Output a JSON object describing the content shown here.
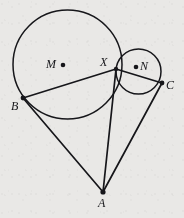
{
  "figure": {
    "type": "geometry-diagram",
    "background_color": "#e9e8e6",
    "stroke_color": "#16161a",
    "width": 184,
    "height": 218,
    "circles": [
      {
        "id": "circle-M",
        "label": "M",
        "cx": 67.5,
        "cy": 64.5,
        "r": 54.5
      },
      {
        "id": "circle-N",
        "label": "N",
        "cx": 138.5,
        "cy": 71.5,
        "r": 22.5
      }
    ],
    "points": [
      {
        "id": "M",
        "label": "M",
        "x": 63,
        "y": 65,
        "dot": true,
        "label_x": 46,
        "label_y": 58
      },
      {
        "id": "N",
        "label": "N",
        "x": 136,
        "y": 67,
        "dot": true,
        "label_x": 140,
        "label_y": 60
      },
      {
        "id": "X",
        "label": "X",
        "x": 116,
        "y": 69,
        "dot": false,
        "label_x": 100,
        "label_y": 56
      },
      {
        "id": "B",
        "label": "B",
        "x": 23,
        "y": 98,
        "dot": true,
        "label_x": 11,
        "label_y": 100
      },
      {
        "id": "C",
        "label": "C",
        "x": 162,
        "y": 83,
        "dot": true,
        "label_x": 166,
        "label_y": 79
      },
      {
        "id": "A",
        "label": "A",
        "x": 103,
        "y": 192,
        "dot": true,
        "label_x": 98,
        "label_y": 197
      }
    ],
    "segments": [
      {
        "id": "segment-BX",
        "from": "B",
        "to": "X"
      },
      {
        "id": "segment-XC",
        "from": "X",
        "to": "C"
      },
      {
        "id": "segment-BA",
        "from": "B",
        "to": "A"
      },
      {
        "id": "segment-XA",
        "from": "X",
        "to": "A"
      },
      {
        "id": "segment-CA",
        "from": "C",
        "to": "A"
      }
    ],
    "labels": {
      "M": "M",
      "N": "N",
      "X": "X",
      "B": "B",
      "C": "C",
      "A": "A"
    }
  }
}
